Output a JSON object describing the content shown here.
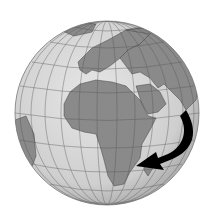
{
  "figure": {
    "colors": {
      "background": "#ffffff",
      "ocean": "#d6d6d6",
      "land": "#8a8a8a",
      "grid": "#555555",
      "arrow": "#000000"
    },
    "annotation": {
      "type": "arrow",
      "description": "Curved black arrow from east of Horn of Africa curving down and pointing west toward southeastern Africa (Mozambique)"
    }
  }
}
